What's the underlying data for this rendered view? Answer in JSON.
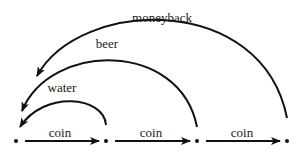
{
  "diagram": {
    "type": "state-transition",
    "nodes": [
      {
        "id": "n0",
        "x": 16,
        "y": 141
      },
      {
        "id": "n1",
        "x": 106,
        "y": 141
      },
      {
        "id": "n2",
        "x": 197,
        "y": 141
      },
      {
        "id": "n3",
        "x": 287,
        "y": 141
      }
    ],
    "edges": [
      {
        "from": "n0",
        "to": "n1",
        "label": "coin",
        "kind": "straight"
      },
      {
        "from": "n1",
        "to": "n2",
        "label": "coin",
        "kind": "straight"
      },
      {
        "from": "n2",
        "to": "n3",
        "label": "coin",
        "kind": "straight"
      },
      {
        "from": "n1",
        "to": "n0",
        "label": "water",
        "kind": "arc"
      },
      {
        "from": "n2",
        "to": "n0",
        "label": "beer",
        "kind": "arc"
      },
      {
        "from": "n3",
        "to": "n0",
        "label": "moneyback",
        "kind": "arc"
      }
    ]
  },
  "labels": {
    "coin_1": "coin",
    "coin_2": "coin",
    "coin_3": "coin",
    "water": "water",
    "beer": "beer",
    "moneyback": "moneyback"
  },
  "colors": {
    "stroke": "#111111",
    "background": "#ffffff"
  }
}
